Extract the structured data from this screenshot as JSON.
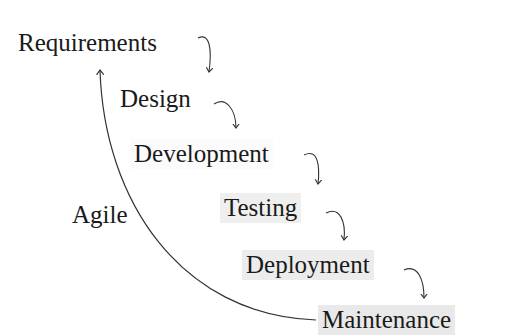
{
  "diagram": {
    "stages": [
      {
        "label": "Requirements",
        "x": 14,
        "y": 28,
        "shade": "#ffffff"
      },
      {
        "label": "Design",
        "x": 116,
        "y": 84,
        "shade": "#ffffff"
      },
      {
        "label": "Development",
        "x": 130,
        "y": 139,
        "shade": "#fbfbfb"
      },
      {
        "label": "Testing",
        "x": 220,
        "y": 193,
        "shade": "#efefef"
      },
      {
        "label": "Deployment",
        "x": 242,
        "y": 250,
        "shade": "#ececec"
      },
      {
        "label": "Maintenance",
        "x": 318,
        "y": 305,
        "shade": "#e9e9e9"
      }
    ],
    "feedback_label": "Agile",
    "feedback_label_pos": {
      "x": 72,
      "y": 200
    },
    "line_color": "#333333"
  }
}
